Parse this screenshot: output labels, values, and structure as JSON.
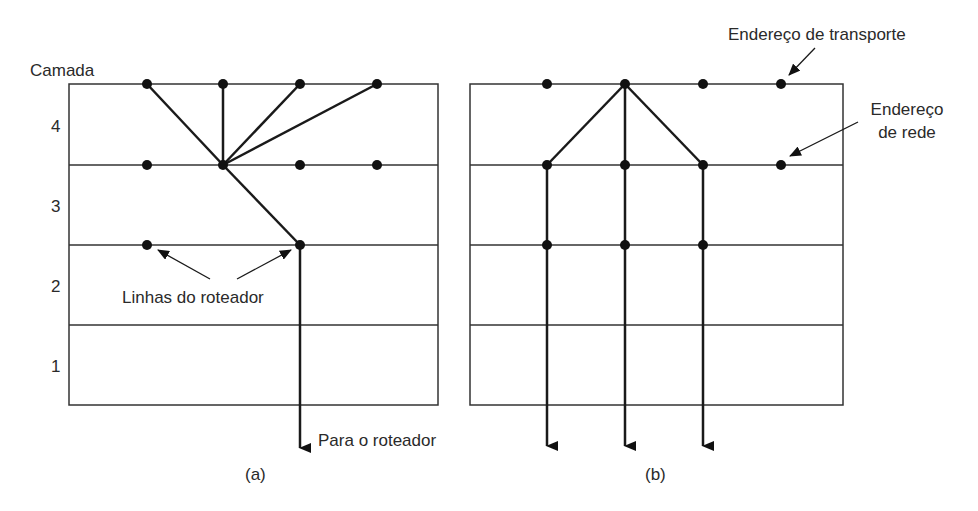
{
  "figure": {
    "panel_a": {
      "caption": "(a)",
      "axis_title": "Camada",
      "layers": [
        "4",
        "3",
        "2",
        "1"
      ],
      "annotation_router_lines": "Linhas do roteador",
      "annotation_to_router": "Para o roteador"
    },
    "panel_b": {
      "caption": "(b)",
      "annotation_transport_address": "Endereço de transporte",
      "annotation_network_address_line1": "Endereço",
      "annotation_network_address_line2": "de rede"
    },
    "colors": {
      "line": "#2b2b2b",
      "dot": "#111111",
      "text": "#2a2a2a",
      "background": "#ffffff"
    }
  }
}
